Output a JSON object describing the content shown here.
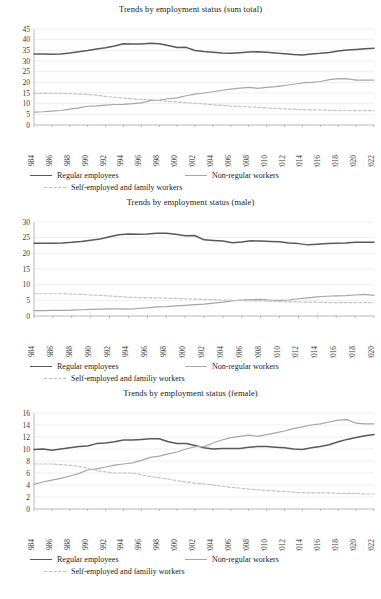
{
  "charts": [
    {
      "id": "sum-total",
      "title": "Trends by employment status (sum total)",
      "legend": {
        "regular": "Regular employees",
        "nonregular": "Non-regular workers",
        "self": "Self-employed and family workers"
      },
      "chart_data": {
        "type": "line",
        "title": "Trends by employment status (sum total)",
        "xlabel": "",
        "ylabel": "",
        "ylim": [
          0,
          45
        ],
        "ytick_step": 5,
        "yticks": [
          0,
          5,
          10,
          15,
          20,
          25,
          30,
          35,
          40,
          45
        ],
        "grid": true,
        "legend_position": "bottom",
        "x": [
          1984,
          1985,
          1986,
          1987,
          1988,
          1989,
          1990,
          1991,
          1992,
          1993,
          1994,
          1995,
          1996,
          1997,
          1998,
          1999,
          2000,
          2001,
          2002,
          2003,
          2004,
          2005,
          2006,
          2007,
          2008,
          2009,
          2010,
          2011,
          2012,
          2013,
          2014,
          2015,
          2016,
          2017,
          2018,
          2019,
          2020,
          2021,
          2022
        ],
        "xtick_labels": [
          1984,
          1986,
          1988,
          1990,
          1992,
          1994,
          1996,
          1998,
          2000,
          2002,
          2004,
          2006,
          2008,
          2010,
          2012,
          2014,
          2016,
          2018,
          2020,
          2022
        ],
        "series": [
          {
            "name": "Regular employees",
            "values": [
              33.3,
              33.3,
              33.2,
              33.3,
              33.7,
              34.3,
              34.9,
              35.6,
              36.2,
              37.0,
              38.1,
              38.0,
              38.0,
              38.3,
              38.1,
              37.3,
              36.3,
              36.4,
              34.9,
              34.4,
              34.1,
              33.7,
              33.6,
              33.9,
              34.2,
              34.3,
              34.1,
              33.7,
              33.4,
              33.0,
              32.8,
              33.3,
              33.6,
              34.0,
              34.7,
              35.1,
              35.4,
              35.7,
              36.0
            ]
          },
          {
            "name": "Non-regular workers",
            "values": [
              6.0,
              6.2,
              6.5,
              6.8,
              7.4,
              8.0,
              8.8,
              9.0,
              9.3,
              9.6,
              9.7,
              10.0,
              10.4,
              11.4,
              11.7,
              12.3,
              12.7,
              13.7,
              14.5,
              15.0,
              15.6,
              16.3,
              16.8,
              17.3,
              17.6,
              17.2,
              17.6,
              18.0,
              18.5,
              19.1,
              19.7,
              20.0,
              20.4,
              21.3,
              21.7,
              21.6,
              21.0,
              21.0,
              21.0
            ]
          },
          {
            "name": "Self-employed and family workers",
            "values": [
              14.8,
              14.8,
              14.9,
              14.8,
              14.7,
              14.5,
              14.3,
              14.0,
              13.4,
              13.0,
              12.6,
              12.2,
              12.0,
              11.9,
              11.4,
              11.1,
              10.8,
              10.5,
              10.2,
              9.9,
              9.5,
              9.2,
              8.9,
              8.7,
              8.5,
              8.3,
              8.0,
              7.8,
              7.6,
              7.4,
              7.2,
              7.1,
              7.0,
              6.9,
              6.8,
              6.8,
              6.7,
              6.7,
              6.7
            ]
          }
        ]
      }
    },
    {
      "id": "male",
      "title": "Trends by employment status (male)",
      "legend": {
        "regular": "Regular employees",
        "nonregular": "Non-regular workers",
        "self": "Self-employed and familiy workers"
      },
      "chart_data": {
        "type": "line",
        "title": "Trends by employment status (male)",
        "xlabel": "",
        "ylabel": "",
        "ylim": [
          0,
          30
        ],
        "ytick_step": 5,
        "yticks": [
          0,
          5,
          10,
          15,
          20,
          25,
          30
        ],
        "grid": true,
        "legend_position": "bottom",
        "x": [
          1984,
          1985,
          1986,
          1987,
          1988,
          1989,
          1990,
          1991,
          1992,
          1993,
          1994,
          1995,
          1996,
          1997,
          1998,
          1999,
          2000,
          2001,
          2002,
          2003,
          2004,
          2005,
          2006,
          2007,
          2008,
          2009,
          2010,
          2011,
          2012,
          2013,
          2014,
          2015,
          2016,
          2017,
          2018,
          2019,
          2020
        ],
        "xtick_labels": [
          1984,
          1986,
          1988,
          1990,
          1992,
          1994,
          1996,
          1998,
          2000,
          2002,
          2004,
          2006,
          2008,
          2010,
          2012,
          2014,
          2016,
          2018,
          2020
        ],
        "series": [
          {
            "name": "Regular employees",
            "values": [
              23.2,
              23.2,
              23.2,
              23.3,
              23.5,
              23.8,
              24.2,
              24.6,
              25.3,
              25.9,
              26.2,
              26.1,
              26.2,
              26.4,
              26.4,
              26.1,
              25.6,
              25.7,
              24.3,
              24.1,
              23.9,
              23.4,
              23.6,
              24.0,
              23.9,
              23.8,
              23.7,
              23.3,
              23.1,
              22.7,
              22.9,
              23.1,
              23.2,
              23.3,
              23.5,
              23.5,
              23.5
            ]
          },
          {
            "name": "Non-regular workers",
            "values": [
              1.7,
              1.7,
              1.8,
              1.8,
              1.9,
              2.0,
              2.1,
              2.2,
              2.3,
              2.3,
              2.2,
              2.4,
              2.6,
              2.9,
              3.0,
              3.2,
              3.4,
              3.6,
              3.8,
              4.1,
              4.4,
              4.8,
              5.1,
              5.2,
              5.3,
              5.1,
              5.0,
              5.1,
              5.5,
              5.8,
              6.1,
              6.3,
              6.4,
              6.5,
              6.7,
              6.9,
              6.6
            ]
          },
          {
            "name": "Self-employed and familiy workers",
            "values": [
              7.1,
              7.1,
              7.1,
              7.1,
              7.0,
              6.9,
              6.7,
              6.6,
              6.4,
              6.2,
              6.0,
              5.9,
              5.8,
              5.8,
              5.7,
              5.6,
              5.5,
              5.4,
              5.3,
              5.2,
              5.1,
              5.0,
              4.9,
              4.8,
              4.8,
              4.7,
              4.6,
              4.5,
              4.5,
              4.4,
              4.4,
              4.3,
              4.3,
              4.3,
              4.3,
              4.3,
              4.2
            ]
          }
        ]
      }
    },
    {
      "id": "female",
      "title": "Trends by employment status (female)",
      "legend": {
        "regular": "Regular employees",
        "nonregular": "Non-regular workers",
        "self": "Self-employed and familiy workers"
      },
      "chart_data": {
        "type": "line",
        "title": "Trends by employment status (female)",
        "xlabel": "",
        "ylabel": "",
        "ylim": [
          0,
          16
        ],
        "ytick_step": 2,
        "yticks": [
          0,
          2,
          4,
          6,
          8,
          10,
          12,
          14,
          16
        ],
        "grid": true,
        "legend_position": "bottom",
        "x": [
          1984,
          1985,
          1986,
          1987,
          1988,
          1989,
          1990,
          1991,
          1992,
          1993,
          1994,
          1995,
          1996,
          1997,
          1998,
          1999,
          2000,
          2001,
          2002,
          2003,
          2004,
          2005,
          2006,
          2007,
          2008,
          2009,
          2010,
          2011,
          2012,
          2013,
          2014,
          2015,
          2016,
          2017,
          2018,
          2019,
          2020,
          2021,
          2022
        ],
        "xtick_labels": [
          1984,
          1986,
          1988,
          1990,
          1992,
          1994,
          1996,
          1998,
          2000,
          2002,
          2004,
          2006,
          2008,
          2010,
          2012,
          2014,
          2016,
          2018,
          2020,
          2022
        ],
        "series": [
          {
            "name": "Regular employees",
            "values": [
              9.9,
              10.0,
              9.8,
              10.0,
              10.2,
              10.4,
              10.5,
              10.9,
              11.0,
              11.2,
              11.5,
              11.5,
              11.6,
              11.7,
              11.7,
              11.2,
              10.9,
              10.9,
              10.6,
              10.2,
              10.0,
              10.1,
              10.1,
              10.1,
              10.3,
              10.4,
              10.4,
              10.3,
              10.2,
              10.0,
              9.9,
              10.2,
              10.4,
              10.7,
              11.2,
              11.6,
              11.9,
              12.2,
              12.4
            ]
          },
          {
            "name": "Non-regular workers",
            "values": [
              4.1,
              4.5,
              4.8,
              5.1,
              5.5,
              5.9,
              6.5,
              6.7,
              7.0,
              7.3,
              7.5,
              7.7,
              8.1,
              8.6,
              8.8,
              9.2,
              9.5,
              10.0,
              10.4,
              10.4,
              11.0,
              11.5,
              11.9,
              12.1,
              12.3,
              12.1,
              12.4,
              12.7,
              13.0,
              13.4,
              13.7,
              14.0,
              14.2,
              14.5,
              14.8,
              14.9,
              14.3,
              14.2,
              14.2
            ]
          },
          {
            "name": "Self-employed and familiy workers",
            "values": [
              7.5,
              7.5,
              7.5,
              7.4,
              7.3,
              7.1,
              6.8,
              6.4,
              6.2,
              6.0,
              6.0,
              6.0,
              5.7,
              5.4,
              5.2,
              5.0,
              4.7,
              4.5,
              4.3,
              4.2,
              4.0,
              3.8,
              3.6,
              3.5,
              3.3,
              3.2,
              3.1,
              3.0,
              2.9,
              2.8,
              2.7,
              2.7,
              2.7,
              2.7,
              2.6,
              2.6,
              2.6,
              2.5,
              2.5
            ]
          }
        ]
      }
    }
  ],
  "colors": {
    "regular": "#595959",
    "nonregular": "#a6a6a6",
    "self": "#c4c4c4",
    "grid": "#e3e3e3",
    "axis": "#9a9a9a",
    "text": "#2b2b2b"
  }
}
